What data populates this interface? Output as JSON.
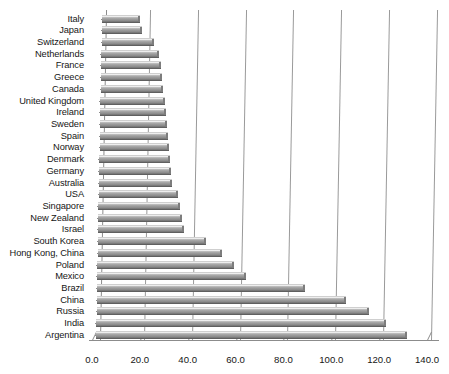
{
  "chart_data": {
    "type": "bar",
    "orientation": "horizontal",
    "title": "",
    "xlabel": "",
    "ylabel": "",
    "xlim": [
      0.0,
      140.0
    ],
    "xticks": [
      "0.0",
      "20.0",
      "40.0",
      "60.0",
      "80.0",
      "100.0",
      "120.0",
      "140.0"
    ],
    "xtick_values": [
      0,
      20,
      40,
      60,
      80,
      100,
      120,
      140
    ],
    "grid": true,
    "legend": false,
    "categories": [
      "Italy",
      "Japan",
      "Switzerland",
      "Netherlands",
      "France",
      "Greece",
      "Canada",
      "United Kingdom",
      "Ireland",
      "Sweden",
      "Spain",
      "Norway",
      "Denmark",
      "Germany",
      "Australia",
      "USA",
      "Singapore",
      "New Zealand",
      "Israel",
      "South Korea",
      "Hong Kong, China",
      "Poland",
      "Mexico",
      "Brazil",
      "China",
      "Russia",
      "India",
      "Argentina"
    ],
    "values": [
      16.0,
      17.0,
      22.0,
      24.0,
      25.0,
      25.5,
      26.0,
      27.0,
      27.5,
      28.0,
      28.5,
      29.0,
      29.5,
      30.0,
      30.5,
      33.0,
      34.0,
      35.0,
      36.0,
      45.0,
      52.0,
      57.0,
      62.0,
      87.0,
      104.0,
      114.0,
      121.0,
      130.0
    ]
  }
}
